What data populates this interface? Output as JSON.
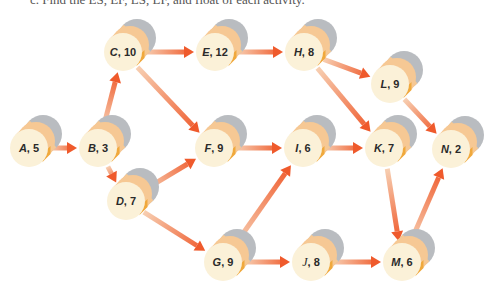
{
  "caption": "c. Find the ES, EF, LS, LF, and float of each activity.",
  "colors": {
    "face": "#fbf1d8",
    "band": "#f6c894",
    "band_dark": "#f0a93c",
    "back_cap": "#b9bcc0",
    "arrow_tail": "#f7cfb2",
    "arrow_head": "#ef5a2c"
  },
  "nodes": [
    {
      "id": "A",
      "name": "A",
      "duration": "5",
      "x": 29,
      "y": 148
    },
    {
      "id": "B",
      "name": "B",
      "duration": "3",
      "x": 98,
      "y": 148
    },
    {
      "id": "C",
      "name": "C",
      "duration": "10",
      "x": 123,
      "y": 52
    },
    {
      "id": "E",
      "name": "E",
      "duration": "12",
      "x": 215,
      "y": 52
    },
    {
      "id": "H",
      "name": "H",
      "duration": "8",
      "x": 304,
      "y": 52
    },
    {
      "id": "L",
      "name": "L",
      "duration": "9",
      "x": 390,
      "y": 84
    },
    {
      "id": "F",
      "name": "F",
      "duration": "9",
      "x": 214,
      "y": 148
    },
    {
      "id": "I",
      "name": "I",
      "duration": "6",
      "x": 303,
      "y": 148
    },
    {
      "id": "K",
      "name": "K",
      "duration": "7",
      "x": 384,
      "y": 148
    },
    {
      "id": "N",
      "name": "N",
      "duration": "2",
      "x": 451,
      "y": 149
    },
    {
      "id": "D",
      "name": "D",
      "duration": "7",
      "x": 126,
      "y": 201
    },
    {
      "id": "G",
      "name": "G",
      "duration": "9",
      "x": 223,
      "y": 262
    },
    {
      "id": "J",
      "name": "J",
      "duration": "8",
      "x": 311,
      "y": 262,
      "script": true
    },
    {
      "id": "M",
      "name": "M",
      "duration": "6",
      "x": 402,
      "y": 262
    }
  ],
  "edges": [
    [
      "A",
      "B"
    ],
    [
      "B",
      "C"
    ],
    [
      "B",
      "D"
    ],
    [
      "C",
      "E"
    ],
    [
      "C",
      "F"
    ],
    [
      "E",
      "H"
    ],
    [
      "H",
      "L"
    ],
    [
      "H",
      "K"
    ],
    [
      "L",
      "N"
    ],
    [
      "D",
      "F"
    ],
    [
      "D",
      "G"
    ],
    [
      "F",
      "I"
    ],
    [
      "G",
      "I"
    ],
    [
      "G",
      "J"
    ],
    [
      "I",
      "K"
    ],
    [
      "K",
      "M"
    ],
    [
      "J",
      "M"
    ],
    [
      "M",
      "N"
    ]
  ]
}
